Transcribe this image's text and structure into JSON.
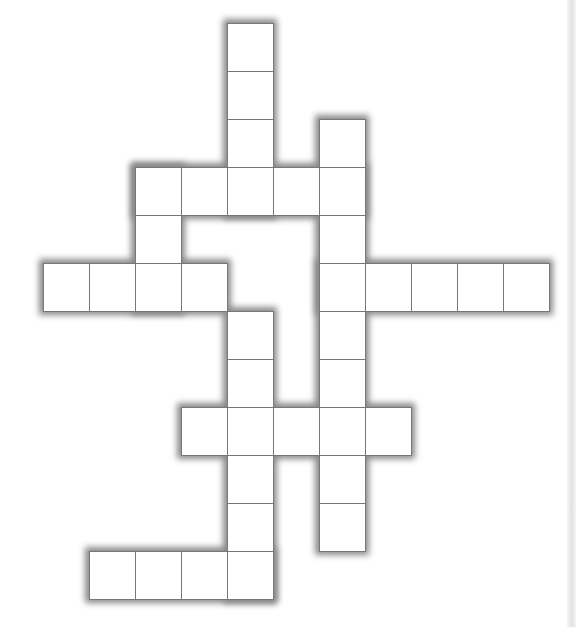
{
  "puzzle": {
    "type": "crossword",
    "grid_origin": {
      "x": 43,
      "y": 23
    },
    "cell_width": 46,
    "cell_height": 48,
    "colors": {
      "cell_fill": "#ffffff",
      "cell_line": "#777777",
      "outline_shadow": "#8a8a8a"
    },
    "words": [
      {
        "id": "w1",
        "direction": "down",
        "col": 4,
        "row": 0,
        "length": 4
      },
      {
        "id": "w2",
        "direction": "across",
        "col": 2,
        "row": 3,
        "length": 5
      },
      {
        "id": "w3",
        "direction": "down",
        "col": 2,
        "row": 3,
        "length": 3
      },
      {
        "id": "w4",
        "direction": "across",
        "col": 0,
        "row": 5,
        "length": 4
      },
      {
        "id": "w5",
        "direction": "down",
        "col": 6,
        "row": 2,
        "length": 9
      },
      {
        "id": "w6",
        "direction": "across",
        "col": 6,
        "row": 5,
        "length": 5
      },
      {
        "id": "w7",
        "direction": "down",
        "col": 4,
        "row": 6,
        "length": 6
      },
      {
        "id": "w8",
        "direction": "across",
        "col": 3,
        "row": 8,
        "length": 5
      },
      {
        "id": "w9",
        "direction": "across",
        "col": 1,
        "row": 11,
        "length": 4
      }
    ],
    "cells": []
  }
}
